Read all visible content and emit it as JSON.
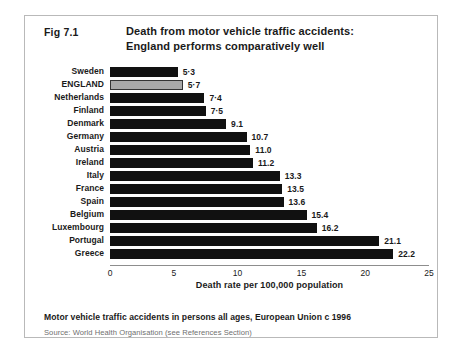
{
  "figure": {
    "number": "Fig 7.1",
    "title_line1": "Death from motor vehicle traffic accidents:",
    "title_line2": "England performs comparatively well",
    "caption": "Motor vehicle traffic accidents in persons all ages, European Union c 1996",
    "source": "Source: World Health Organisation (see References Section)",
    "highlight_color": "#a8a8a8",
    "bar_color": "#111111"
  },
  "chart_data": {
    "type": "bar",
    "orientation": "horizontal",
    "title": "Death from motor vehicle traffic accidents: England performs comparatively well",
    "xlabel": "Death rate per 100,000 population",
    "ylabel": "",
    "xlim": [
      0,
      25
    ],
    "xticks": [
      "0",
      "5",
      "10",
      "15",
      "20",
      "25"
    ],
    "grid": false,
    "legend": false,
    "highlight_category": "ENGLAND",
    "categories": [
      "Sweden",
      "ENGLAND",
      "Netherlands",
      "Finland",
      "Denmark",
      "Germany",
      "Austria",
      "Ireland",
      "Italy",
      "France",
      "Spain",
      "Belgium",
      "Luxembourg",
      "Portugal",
      "Greece"
    ],
    "values": [
      5.3,
      5.7,
      7.4,
      7.5,
      9.1,
      10.7,
      11.0,
      11.2,
      13.3,
      13.5,
      13.6,
      15.4,
      16.2,
      21.1,
      22.2
    ],
    "value_labels": [
      "5·3",
      "5·7",
      "7·4",
      "7·5",
      "9.1",
      "10.7",
      "11.0",
      "11.2",
      "13.3",
      "13.5",
      "13.6",
      "15.4",
      "16.2",
      "21.1",
      "22.2"
    ]
  }
}
